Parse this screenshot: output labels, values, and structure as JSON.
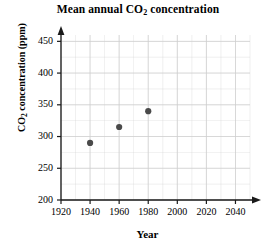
{
  "chart_data": {
    "type": "scatter",
    "title": "Mean annual CO2 concentration",
    "title_parts": {
      "pre": "Mean annual CO",
      "sub": "2",
      "post": " concentration"
    },
    "xlabel": "Year",
    "ylabel": "CO2 concentration (ppm)",
    "ylabel_parts": {
      "pre": "CO",
      "sub": "2",
      "post": " concentration (ppm)"
    },
    "x": [
      1940,
      1960,
      1980
    ],
    "values": [
      290,
      315,
      340
    ],
    "points": [
      {
        "x": 1940,
        "y": 290
      },
      {
        "x": 1960,
        "y": 315
      },
      {
        "x": 1980,
        "y": 340
      }
    ],
    "xlim": [
      1920,
      2050
    ],
    "ylim": [
      200,
      460
    ],
    "xticks": [
      1920,
      1940,
      1960,
      1980,
      2000,
      2020,
      2040
    ],
    "yticks": [
      200,
      250,
      300,
      350,
      400,
      450
    ],
    "xtick_labels": [
      "1920",
      "1940",
      "1960",
      "1980",
      "2000",
      "2020",
      "2040"
    ],
    "ytick_labels": [
      "200",
      "250",
      "300",
      "350",
      "400",
      "450"
    ],
    "x_minor_step": 10,
    "y_minor_step": 25,
    "grid": true,
    "legend": null,
    "marker_color": "#4a4a4a",
    "grid_color": "#cfcfcf",
    "axis_color": "#1a1a1a"
  }
}
